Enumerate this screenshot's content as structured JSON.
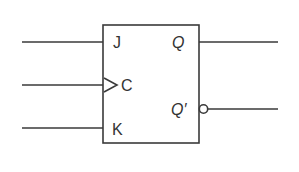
{
  "diagram": {
    "type": "JK flip-flop",
    "colors": {
      "stroke": "#3a3a3a",
      "text": "#333333",
      "background": "#ffffff"
    },
    "inputs": [
      {
        "id": "J",
        "label": "J",
        "clocked": false
      },
      {
        "id": "C",
        "label": "C",
        "clocked": true
      },
      {
        "id": "K",
        "label": "K",
        "clocked": false
      }
    ],
    "outputs": [
      {
        "id": "Q",
        "label": "Q",
        "inverted": false
      },
      {
        "id": "Qbar",
        "label": "Q′",
        "inverted": true
      }
    ]
  }
}
